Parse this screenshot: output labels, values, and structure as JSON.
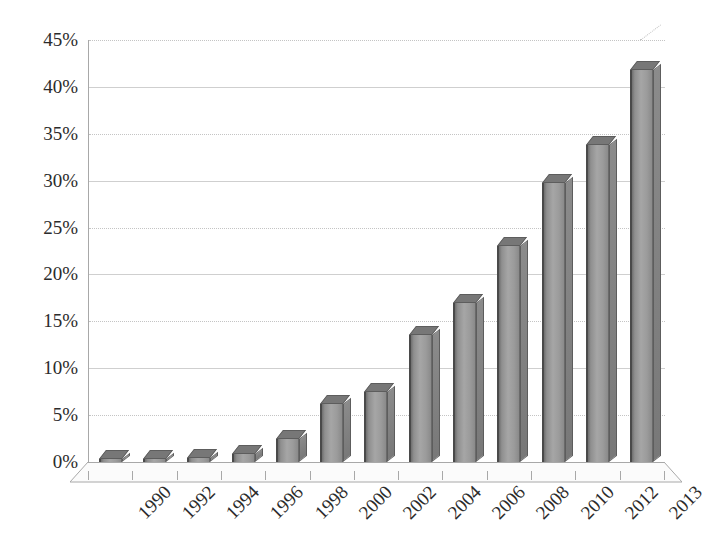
{
  "chart_data": {
    "type": "bar",
    "title": "",
    "subtitle": "",
    "xlabel": "",
    "ylabel": "",
    "categories": [
      "1990",
      "1992",
      "1994",
      "1996",
      "1998",
      "2000",
      "2002",
      "2004",
      "2006",
      "2008",
      "2010",
      "2012",
      "2013"
    ],
    "values": [
      0.1,
      0.3,
      0.4,
      0.9,
      2.5,
      6.2,
      7.5,
      13.5,
      17.0,
      23.0,
      29.8,
      33.8,
      41.8
    ],
    "series": [
      {
        "name": "",
        "values": [
          0.1,
          0.3,
          0.4,
          0.9,
          2.5,
          6.2,
          7.5,
          13.5,
          17.0,
          23.0,
          29.8,
          33.8,
          41.8
        ]
      }
    ],
    "ylim": [
      0,
      45
    ],
    "ytick_step": 5,
    "ytick_labels": [
      "0%",
      "5%",
      "10%",
      "15%",
      "20%",
      "25%",
      "30%",
      "35%",
      "40%",
      "45%"
    ],
    "ytick_values": [
      0,
      5,
      10,
      15,
      20,
      25,
      30,
      35,
      40,
      45
    ],
    "xtick_labels": [
      "1990",
      "1992",
      "1994",
      "1996",
      "1998",
      "2000",
      "2002",
      "2004",
      "2006",
      "2008",
      "2010",
      "2012",
      "2013"
    ],
    "xtick_rotation": -45,
    "grid": true,
    "grid_axis": "y",
    "legend": false,
    "legend_position": "none",
    "value_suffix": "%",
    "perspective_3d": true,
    "annotations": []
  },
  "style": {
    "bar_fill_light": "#a6a6a6",
    "bar_fill_dark": "#6f6f6f",
    "bar_edge": "#4a4a4a",
    "bar_top_face": "#777777",
    "gridline_color": "#cfcfcf",
    "axis_color": "#a8a8a8",
    "text_color": "#2b2b2b",
    "background": "#ffffff"
  }
}
